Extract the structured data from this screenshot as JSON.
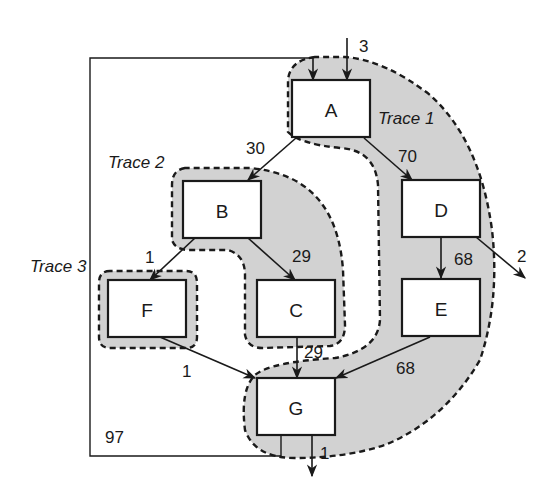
{
  "diagram": {
    "nodes": [
      {
        "id": "A",
        "label": "A"
      },
      {
        "id": "B",
        "label": "B"
      },
      {
        "id": "C",
        "label": "C"
      },
      {
        "id": "D",
        "label": "D"
      },
      {
        "id": "E",
        "label": "E"
      },
      {
        "id": "F",
        "label": "F"
      },
      {
        "id": "G",
        "label": "G"
      }
    ],
    "traces": [
      {
        "id": "trace1",
        "label": "Trace 1",
        "members": [
          "A",
          "D",
          "E",
          "G"
        ]
      },
      {
        "id": "trace2",
        "label": "Trace 2",
        "members": [
          "B",
          "C"
        ]
      },
      {
        "id": "trace3",
        "label": "Trace 3",
        "members": [
          "F"
        ]
      }
    ],
    "edges": [
      {
        "from": "entry",
        "to": "A",
        "label": "3"
      },
      {
        "from": "A",
        "to": "B",
        "label": "30"
      },
      {
        "from": "A",
        "to": "D",
        "label": "70"
      },
      {
        "from": "B",
        "to": "F",
        "label": "1"
      },
      {
        "from": "B",
        "to": "C",
        "label": "29"
      },
      {
        "from": "D",
        "to": "exit",
        "label": "2"
      },
      {
        "from": "D",
        "to": "E",
        "label": "68"
      },
      {
        "from": "C",
        "to": "G",
        "label": "29"
      },
      {
        "from": "F",
        "to": "G",
        "label": "1"
      },
      {
        "from": "E",
        "to": "G",
        "label": "68"
      },
      {
        "from": "G",
        "to": "exit",
        "label": "1"
      },
      {
        "from": "G",
        "to": "A",
        "label": "97"
      }
    ]
  }
}
